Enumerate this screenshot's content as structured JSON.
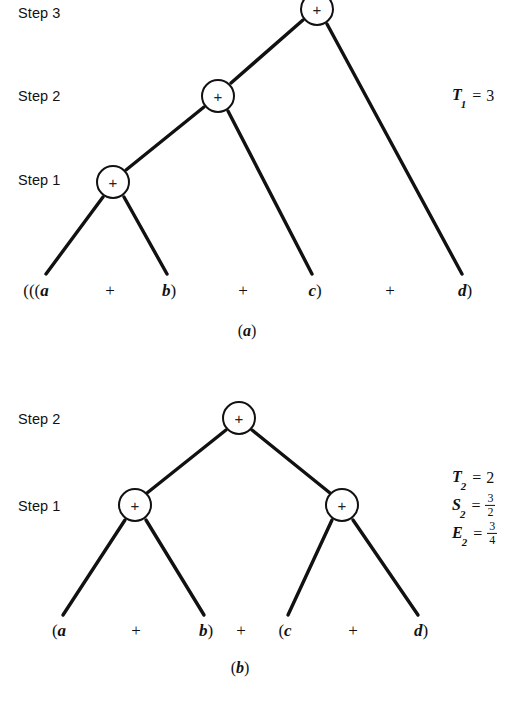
{
  "figure": {
    "line_color": "#111111",
    "node_fill": "#ffffff",
    "background": "#ffffff"
  },
  "panel_a": {
    "caption": "(a)",
    "caption_open": "(",
    "caption_letter": "a",
    "caption_close": ")",
    "step_labels": [
      {
        "id": "step-3",
        "text": "Step 3"
      },
      {
        "id": "step-2",
        "text": "Step 2"
      },
      {
        "id": "step-1",
        "text": "Step 1"
      }
    ],
    "nodes": [
      {
        "id": "a-step3-root",
        "label": "+",
        "step": "Step 3"
      },
      {
        "id": "a-step2",
        "label": "+",
        "step": "Step 2"
      },
      {
        "id": "a-step1",
        "label": "+",
        "step": "Step 1"
      }
    ],
    "leaves": [
      {
        "id": "a-leaf-a",
        "open": "(((",
        "letter": "a",
        "close": ""
      },
      {
        "id": "a-op-1",
        "text": "+"
      },
      {
        "id": "a-leaf-b",
        "open": "",
        "letter": "b",
        "close": ")"
      },
      {
        "id": "a-op-2",
        "text": "+"
      },
      {
        "id": "a-leaf-c",
        "open": "",
        "letter": "c",
        "close": ")"
      },
      {
        "id": "a-op-3",
        "text": "+"
      },
      {
        "id": "a-leaf-d",
        "open": "",
        "letter": "d",
        "close": ")"
      }
    ],
    "expression": "(((a + b) + c) + d)",
    "metrics": [
      {
        "id": "T1",
        "symbol": "T",
        "subscript": "1",
        "equals": "=",
        "value": "3",
        "kind": "integer"
      }
    ]
  },
  "panel_b": {
    "caption": "(b)",
    "caption_open": "(",
    "caption_letter": "b",
    "caption_close": ")",
    "step_labels": [
      {
        "id": "step-2",
        "text": "Step 2"
      },
      {
        "id": "step-1",
        "text": "Step 1"
      }
    ],
    "nodes": [
      {
        "id": "b-step2-root",
        "label": "+",
        "step": "Step 2"
      },
      {
        "id": "b-step1-left",
        "label": "+",
        "step": "Step 1"
      },
      {
        "id": "b-step1-right",
        "label": "+",
        "step": "Step 1"
      }
    ],
    "leaves": [
      {
        "id": "b-leaf-a",
        "open": "(",
        "letter": "a",
        "close": ""
      },
      {
        "id": "b-op-1",
        "text": "+"
      },
      {
        "id": "b-leaf-b",
        "open": "",
        "letter": "b",
        "close": ")"
      },
      {
        "id": "b-op-2",
        "text": "+"
      },
      {
        "id": "b-leaf-c",
        "open": "(",
        "letter": "c",
        "close": ""
      },
      {
        "id": "b-op-3",
        "text": "+"
      },
      {
        "id": "b-leaf-d",
        "open": "",
        "letter": "d",
        "close": ")"
      }
    ],
    "expression": "(a + b) + (c + d)",
    "metrics": [
      {
        "id": "T2",
        "symbol": "T",
        "subscript": "2",
        "equals": "=",
        "value": "2",
        "kind": "integer"
      },
      {
        "id": "S2",
        "symbol": "S",
        "subscript": "2",
        "equals": "=",
        "numerator": "3",
        "denominator": "2",
        "kind": "fraction"
      },
      {
        "id": "E2",
        "symbol": "E",
        "subscript": "2",
        "equals": "=",
        "numerator": "3",
        "denominator": "4",
        "kind": "fraction"
      }
    ]
  }
}
